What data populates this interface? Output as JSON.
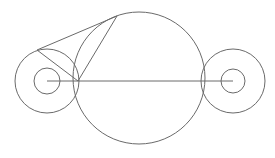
{
  "diagram": {
    "type": "geometric-construction",
    "stroke_color": "#6a6a6a",
    "background": "#ffffff",
    "circles": [
      {
        "id": "big-circle",
        "cx": 139,
        "cy": 78,
        "r": 66
      },
      {
        "id": "left-outer-circle",
        "cx": 47,
        "cy": 81,
        "r": 32
      },
      {
        "id": "left-inner-circle",
        "cx": 47,
        "cy": 81,
        "r": 13
      },
      {
        "id": "right-outer-circle",
        "cx": 233,
        "cy": 81,
        "r": 32
      },
      {
        "id": "right-inner-circle",
        "cx": 233,
        "cy": 81,
        "r": 12
      }
    ],
    "lines": [
      {
        "id": "center-axis-line",
        "x1": 47,
        "y1": 81,
        "x2": 233,
        "y2": 81
      },
      {
        "id": "tangent-top-line",
        "x1": 37,
        "y1": 50,
        "x2": 117,
        "y2": 16
      },
      {
        "id": "tangent-radius-line",
        "x1": 37,
        "y1": 50,
        "x2": 78,
        "y2": 81
      },
      {
        "id": "apex-chord-line",
        "x1": 117,
        "y1": 16,
        "x2": 78,
        "y2": 81
      }
    ]
  }
}
